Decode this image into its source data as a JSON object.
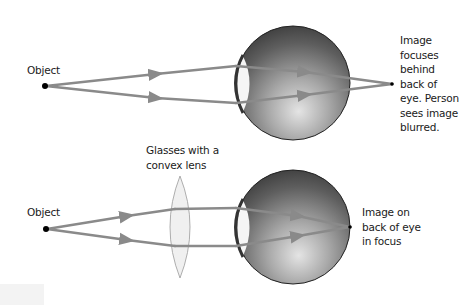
{
  "figure": {
    "colors": {
      "ray": "#8a8a8a",
      "eye_dark": "#3c3c3c",
      "eye_light": "#d8d8d8",
      "eye_outline": "#222222",
      "cornea_fill": "#f4f4f4",
      "lens_fill": "#f2f2f2",
      "lens_stroke": "#9a9a9a",
      "dot": "#000000"
    }
  },
  "top_panel": {
    "object_label": "Object",
    "result_label_lines": [
      "Image",
      "focuses",
      "behind",
      "back of",
      "eye. Person",
      "sees image",
      "blurred."
    ]
  },
  "bottom_panel": {
    "object_label": "Object",
    "lens_label_lines": [
      "Glasses with a",
      "convex lens"
    ],
    "result_label_lines": [
      "Image on",
      "back of eye",
      "in focus"
    ]
  }
}
